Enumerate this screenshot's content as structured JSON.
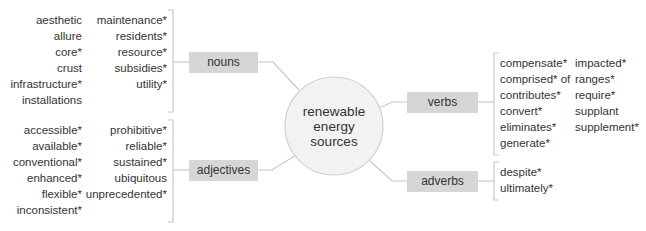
{
  "diagram": {
    "center": {
      "lines": [
        "renewable",
        "energy",
        "sources"
      ]
    },
    "colors": {
      "box_fill": "#d6d6d6",
      "line": "#c8c8c8",
      "circle_fill": "#f2f2f2",
      "text": "#333333"
    },
    "branches": {
      "nouns": {
        "label": "nouns",
        "col1": [
          "aesthetic",
          "allure",
          "core*",
          "crust",
          "infrastructure*",
          "installations"
        ],
        "col2": [
          "maintenance*",
          "residents*",
          "resource*",
          "subsidies*",
          "utility*"
        ]
      },
      "adjectives": {
        "label": "adjectives",
        "col1": [
          "accessible*",
          "available*",
          "conventional*",
          "enhanced*",
          "flexible*",
          "inconsistent*"
        ],
        "col2": [
          "prohibitive*",
          "reliable*",
          "sustained*",
          "ubiquitous",
          "unprecedented*"
        ]
      },
      "verbs": {
        "label": "verbs",
        "col1": [
          "compensate*",
          "comprised* of",
          "contributes*",
          "convert*",
          "eliminates*",
          "generate*"
        ],
        "col2": [
          "impacted*",
          "ranges*",
          "require*",
          "supplant",
          "supplement*"
        ]
      },
      "adverbs": {
        "label": "adverbs",
        "col1": [
          "despite*",
          "ultimately*"
        ]
      }
    }
  }
}
